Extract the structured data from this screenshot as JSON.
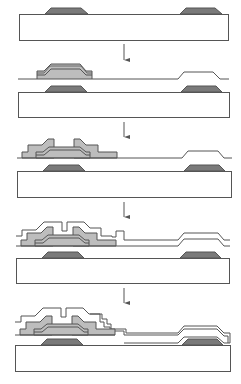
{
  "diagram": {
    "colors": {
      "background": "#ffffff",
      "outline": "#555555",
      "substrate_fill": "#ffffff",
      "gate_fill": "#7a7a7a",
      "semiconductor_fill": "#bdbdbd",
      "film_fill": "#ffffff"
    },
    "stages": [
      {
        "index": 1,
        "description": "Substrate with two gate electrodes"
      },
      {
        "index": 2,
        "description": "Gate insulator and semiconductor layers deposited"
      },
      {
        "index": 3,
        "description": "Source/drain electrodes patterned"
      },
      {
        "index": 4,
        "description": "Passivation layer deposited"
      },
      {
        "index": 5,
        "description": "Pixel electrode / top layer formed"
      }
    ],
    "arrows": 4,
    "caption": ""
  }
}
